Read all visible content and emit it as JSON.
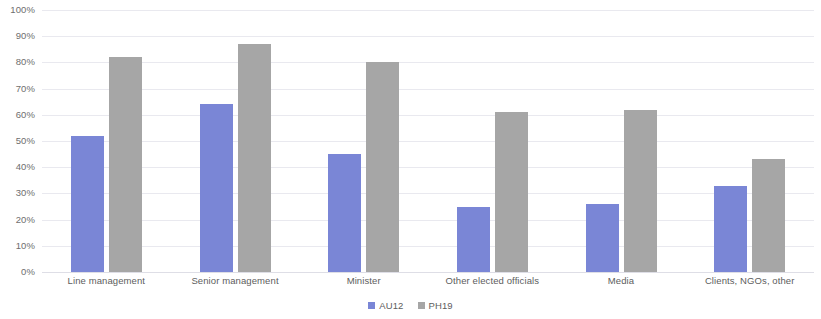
{
  "chart_data": {
    "type": "bar",
    "title": "",
    "subtitle": "",
    "xlabel": "",
    "ylabel": "",
    "ylim": [
      0,
      100
    ],
    "y_unit": "%",
    "grid": true,
    "legend_position": "bottom",
    "y_ticks": [
      "0%",
      "10%",
      "20%",
      "30%",
      "40%",
      "50%",
      "60%",
      "70%",
      "80%",
      "90%",
      "100%"
    ],
    "y_tick_values": [
      0,
      10,
      20,
      30,
      40,
      50,
      60,
      70,
      80,
      90,
      100
    ],
    "categories": [
      "Line management",
      "Senior management",
      "Minister",
      "Other elected officials",
      "Media",
      "Clients, NGOs, other"
    ],
    "series": [
      {
        "name": "AU12",
        "color": "#7a86d6",
        "values": [
          52,
          64,
          45,
          25,
          26,
          33
        ]
      },
      {
        "name": "PH19",
        "color": "#a6a6a6",
        "values": [
          82,
          87,
          80,
          61,
          62,
          43
        ]
      }
    ]
  },
  "colors": {
    "series_au12": "#7a86d6",
    "series_ph19": "#a6a6a6",
    "gridline": "#e9e9ef",
    "axis_text": "#6e6e6e",
    "background": "#ffffff"
  }
}
